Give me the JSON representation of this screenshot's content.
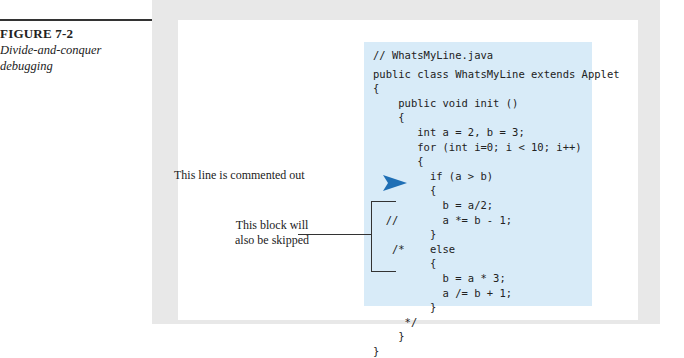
{
  "figure": {
    "number": "FIGURE 7-2",
    "title_line1": "Divide-and-conquer",
    "title_line2": "debugging"
  },
  "code": {
    "filename_comment": "// WhatsMyLine.java",
    "lines": [
      "public class WhatsMyLine extends Applet",
      "{",
      "    public void init ()",
      "    {",
      "       int a = 2, b = 3;",
      "       for (int i=0; i < 10; i++)",
      "       {",
      "         if (a > b)",
      "         {",
      "           b = a/2;",
      "  //       a *= b - 1;",
      "         }",
      "   /*    else",
      "         {",
      "           b = a * 3;",
      "           a /= b + 1;",
      "         }",
      "     */",
      "    }",
      "}"
    ]
  },
  "annotations": {
    "commented_line": "This line is commented out",
    "skipped_block_line1": "This block will",
    "skipped_block_line2": "also be skipped"
  },
  "colors": {
    "code_background": "#d8ebf8",
    "arrow": "#1f6fb5"
  }
}
